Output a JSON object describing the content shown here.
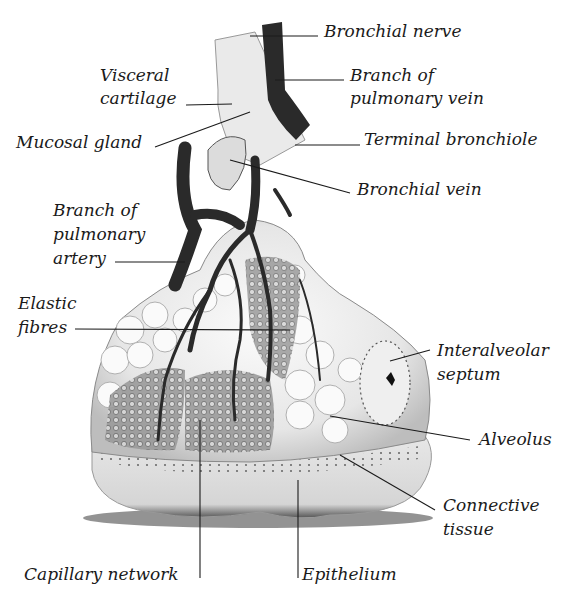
{
  "diagram": {
    "labels": {
      "bronchial_nerve": "Bronchial nerve",
      "visceral_cartilage_1": "Visceral",
      "visceral_cartilage_2": "cartilage",
      "branch_pulmonary_vein_1": "Branch of",
      "branch_pulmonary_vein_2": "pulmonary vein",
      "mucosal_gland": "Mucosal gland",
      "terminal_bronchiole": "Terminal bronchiole",
      "bronchial_vein": "Bronchial vein",
      "branch_pulmonary_artery_1": "Branch of",
      "branch_pulmonary_artery_2": "pulmonary",
      "branch_pulmonary_artery_3": "artery",
      "elastic_fibres_1": "Elastic",
      "elastic_fibres_2": "fibres",
      "interalveolar_septum_1": "Interalveolar",
      "interalveolar_septum_2": "septum",
      "alveolus": "Alveolus",
      "connective_tissue_1": "Connective",
      "connective_tissue_2": "tissue",
      "capillary_network": "Capillary network",
      "epithelium": "Epithelium"
    },
    "colors": {
      "vessel": "#2a2a2a",
      "tissue_light": "#f2f2f2",
      "tissue_mid": "#cfcfcf",
      "leader_line": "#1a1a1a"
    }
  }
}
